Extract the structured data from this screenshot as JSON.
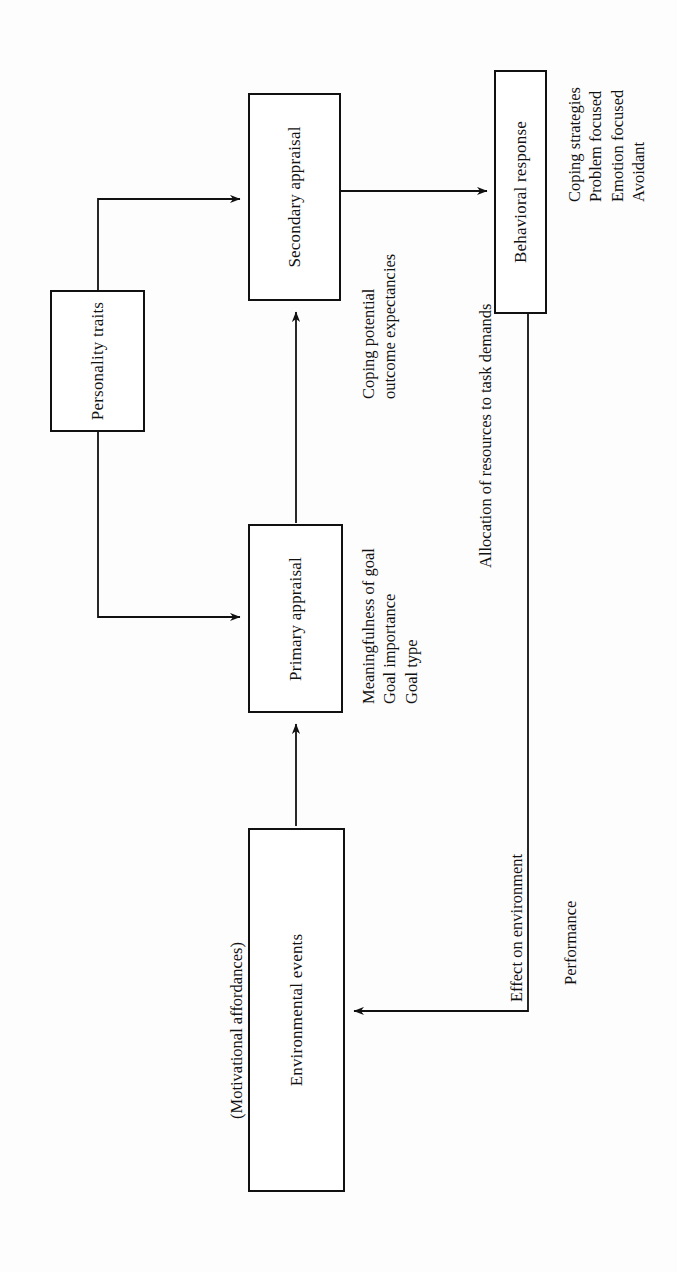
{
  "diagram": {
    "orientation": "rotated-90-counterclockwise",
    "nodes": [
      {
        "id": "environmental_events",
        "label": "Environmental events"
      },
      {
        "id": "primary_appraisal",
        "label": "Primary appraisal"
      },
      {
        "id": "secondary_appraisal",
        "label": "Secondary appraisal"
      },
      {
        "id": "personality_traits",
        "label": "Personality\ntraits"
      },
      {
        "id": "behavioral_response",
        "label": "Behavioral response"
      }
    ],
    "captions": [
      {
        "id": "motivational_affordances",
        "text": "(Motivational affordances)"
      },
      {
        "id": "primary_appraisal_detail",
        "text": "Meaningfulness of goal\nGoal importance\nGoal type"
      },
      {
        "id": "secondary_appraisal_detail",
        "text": "Coping potential\noutcome expectancies"
      },
      {
        "id": "allocation_label",
        "text": "Allocation of resources to task demands"
      },
      {
        "id": "coping_strategies_detail",
        "text": "Coping strategies\nProblem focused\nEmotion focused\nAvoidant"
      },
      {
        "id": "effect_on_environment",
        "text": "Effect on environment"
      },
      {
        "id": "performance",
        "text": "Performance"
      }
    ],
    "edges": [
      {
        "id": "env-to-primary",
        "from": "environmental_events",
        "to": "primary_appraisal",
        "arrow": true
      },
      {
        "id": "primary-to-secondary",
        "from": "primary_appraisal",
        "to": "secondary_appraisal",
        "arrow": true
      },
      {
        "id": "traits-to-secondary",
        "from": "personality_traits",
        "to": "secondary_appraisal",
        "arrow": true
      },
      {
        "id": "traits-to-primary",
        "from": "personality_traits",
        "to": "primary_appraisal",
        "arrow": true
      },
      {
        "id": "secondary-to-behavioral",
        "from": "secondary_appraisal",
        "to": "behavioral_response",
        "arrow": true
      },
      {
        "id": "behavioral-to-env",
        "from": "behavioral_response",
        "to": "environmental_events",
        "arrow": true
      }
    ],
    "colors": {
      "stroke": "#111111",
      "background": "#fdfdfd",
      "text": "#111111"
    }
  }
}
